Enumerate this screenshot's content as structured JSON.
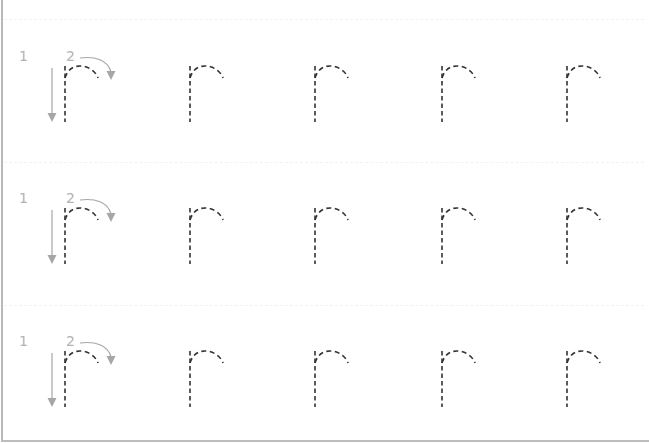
{
  "worksheet": {
    "letter": "r",
    "rows": [
      {
        "guide": {
          "step1_label": "1",
          "step2_label": "2",
          "step1_icon": "down-arrow-icon",
          "step2_icon": "curved-arrow-icon"
        },
        "letters": [
          "r",
          "r",
          "r",
          "r",
          "r"
        ]
      },
      {
        "guide": {
          "step1_label": "1",
          "step2_label": "2",
          "step1_icon": "down-arrow-icon",
          "step2_icon": "curved-arrow-icon"
        },
        "letters": [
          "r",
          "r",
          "r",
          "r",
          "r"
        ]
      },
      {
        "guide": {
          "step1_label": "1",
          "step2_label": "2",
          "step1_icon": "down-arrow-icon",
          "step2_icon": "curved-arrow-icon"
        },
        "letters": [
          "r",
          "r",
          "r",
          "r",
          "r"
        ]
      }
    ],
    "colors": {
      "trace_stroke": "#333333",
      "guide_arrow": "#a6a6a6",
      "guide_number": "#b3b3b3",
      "border": "#b8b8b8"
    }
  }
}
